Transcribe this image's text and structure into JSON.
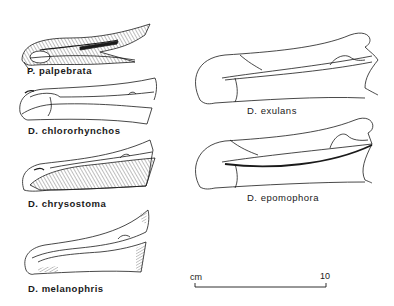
{
  "figure": {
    "type": "scientific illustration",
    "specimens": [
      {
        "id": "palpebrata",
        "label": "P. palpebrata",
        "position": "left-1"
      },
      {
        "id": "chlororhynchos",
        "label": "D. chlororhynchos",
        "position": "left-2"
      },
      {
        "id": "chrysostoma",
        "label": "D. chrysostoma",
        "position": "left-3"
      },
      {
        "id": "melanophris",
        "label": "D. melanophris",
        "position": "left-4"
      },
      {
        "id": "exulans",
        "label": "D. exulans",
        "position": "right-1"
      },
      {
        "id": "epomophora",
        "label": "D. epomophora",
        "position": "right-2"
      }
    ],
    "scale_bar": {
      "unit_label": "cm",
      "end_label": "10"
    }
  },
  "colors": {
    "ink": "#1a1a1a",
    "paper": "#ffffff",
    "hatch": "#555555"
  }
}
